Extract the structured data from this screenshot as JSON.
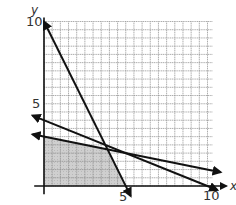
{
  "chart_data": {
    "type": "line",
    "title": "",
    "xlabel": "x",
    "ylabel": "y",
    "xlim": [
      0,
      10.3
    ],
    "ylim": [
      0,
      10
    ],
    "grid": true,
    "grid_step": 0.5,
    "tick_labels": {
      "x": [
        {
          "value": 5,
          "label": "5"
        },
        {
          "value": 10,
          "label": "10"
        }
      ],
      "y": [
        {
          "value": 5,
          "label": "5"
        },
        {
          "value": 10,
          "label": "10"
        }
      ]
    },
    "series": [
      {
        "name": "2x + y = 10",
        "points": [
          [
            0,
            10
          ],
          [
            5.3,
            -0.6
          ]
        ]
      },
      {
        "name": "x + 2.5y = 10",
        "points": [
          [
            -0.7,
            4.28
          ],
          [
            10,
            0
          ],
          [
            10.6,
            -0.24
          ]
        ]
      },
      {
        "name": "x + 5y = 15",
        "points": [
          [
            -0.7,
            3.14
          ],
          [
            10.8,
            0.84
          ]
        ]
      }
    ],
    "shaded_region": {
      "description": "feasible region (x >= 0, y >= 0, below all three lines)",
      "vertices": [
        [
          0,
          0
        ],
        [
          0,
          3
        ],
        [
          3.89,
          2.22
        ],
        [
          5,
          0
        ]
      ],
      "color": "#c8c8c8"
    },
    "legend": null
  },
  "labels": {
    "y_axis": "y",
    "x_axis": "x",
    "y_tick_10": "10",
    "y_tick_5": "5",
    "x_tick_5": "5",
    "x_tick_10": "10"
  }
}
